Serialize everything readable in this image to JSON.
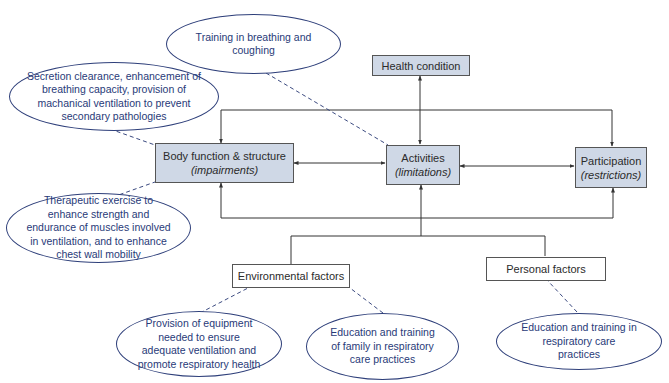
{
  "diagram": {
    "type": "ICF model - respiratory care interventions",
    "colors": {
      "main_box_fill": "#cfd8e6",
      "box_border": "#555555",
      "oval_border": "#2e3f7a",
      "oval_text": "#283a78",
      "connector": "#333333",
      "dashed_connector": "#3b4a80"
    },
    "nodes": {
      "health_condition": {
        "label": "Health condition"
      },
      "body_function": {
        "label": "Body function & structure",
        "sublabel": "(impairments)"
      },
      "activities": {
        "label": "Activities",
        "sublabel": "(limitations)"
      },
      "participation": {
        "label": "Participation",
        "sublabel": "(restrictions)"
      },
      "environmental_factors": {
        "label": "Environmental factors"
      },
      "personal_factors": {
        "label": "Personal factors"
      }
    },
    "interventions": {
      "breathing_coughing": {
        "text": "Training in breathing and coughing",
        "linked_to": "activities"
      },
      "secretion_clearance": {
        "text": "Secretion clearance, enhancement of breathing capacity, provision of machanical ventilation to prevent secondary pathologies",
        "linked_to": "body_function"
      },
      "therapeutic_exercise": {
        "text": "Therapeutic exercise to enhance strength and endurance of muscles involved in ventilation, and to enhance chest wall mobility",
        "linked_to": "body_function"
      },
      "equipment": {
        "text": "Provision of equipment needed to ensure adequate ventilation and promote respiratory health",
        "linked_to": "environmental_factors"
      },
      "family_education": {
        "text": "Education and training of family in respiratory care practices",
        "linked_to": "environmental_factors"
      },
      "personal_education": {
        "text": "Education and training in respiratory care practices",
        "linked_to": "personal_factors"
      }
    },
    "edges": [
      {
        "from": "health_condition",
        "to": "activities",
        "style": "solid",
        "arrows": "both"
      },
      {
        "from": "body_function",
        "to": "activities",
        "style": "solid",
        "arrows": "both"
      },
      {
        "from": "activities",
        "to": "participation",
        "style": "solid",
        "arrows": "both"
      },
      {
        "from": "health_condition",
        "to": "body_function",
        "style": "solid",
        "arrows": "to",
        "via": "top loop"
      },
      {
        "from": "health_condition",
        "to": "participation",
        "style": "solid",
        "arrows": "to",
        "via": "top loop"
      },
      {
        "from": "participation",
        "to": "body_function",
        "style": "solid",
        "arrows": "both",
        "via": "bottom loop"
      },
      {
        "from": "environmental_factors",
        "to": "activities",
        "style": "solid",
        "arrows": "to"
      },
      {
        "from": "personal_factors",
        "to": "activities",
        "style": "solid",
        "arrows": "to"
      }
    ]
  }
}
